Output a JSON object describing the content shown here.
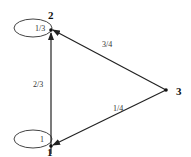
{
  "diagram": {
    "type": "markov-chain",
    "nodes": [
      {
        "id": "1",
        "label": "1",
        "self_loop": "1"
      },
      {
        "id": "2",
        "label": "2",
        "self_loop": "1/3"
      },
      {
        "id": "3",
        "label": "3"
      }
    ],
    "edges": [
      {
        "from": "1",
        "to": "2",
        "label": "2/3"
      },
      {
        "from": "3",
        "to": "2",
        "label": "3/4"
      },
      {
        "from": "3",
        "to": "1",
        "label": "1/4"
      }
    ],
    "colors": {
      "stroke": "#333333",
      "background": "#ffffff"
    }
  }
}
